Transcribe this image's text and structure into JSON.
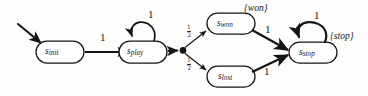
{
  "diagram": {
    "type": "markov-decision-state-machine",
    "title": "",
    "stroke_color": "#141414",
    "background_color": "#fdfdfb",
    "states": [
      {
        "id": "s_init",
        "base": "s",
        "subscript": "init",
        "x": 60,
        "y": 52
      },
      {
        "id": "s_play",
        "base": "s",
        "subscript": "play",
        "x": 143,
        "y": 52
      },
      {
        "id": "s_won",
        "base": "s",
        "subscript": "won",
        "x": 231,
        "y": 23
      },
      {
        "id": "s_lost",
        "base": "s",
        "subscript": "lost",
        "x": 231,
        "y": 77
      },
      {
        "id": "s_stop",
        "base": "s",
        "subscript": "stop",
        "x": 313,
        "y": 52
      }
    ],
    "branch_node": {
      "id": "probabilistic-branch-point",
      "x": 182,
      "y": 50
    },
    "start_arrow": {
      "id": "initial-state-arrow",
      "from_x": 18,
      "from_y": 24,
      "to_x": 43,
      "to_y": 44
    },
    "transitions": [
      {
        "id": "init-to-play",
        "from": "s_init",
        "to": "s_play",
        "label": "1"
      },
      {
        "id": "play-self-loop",
        "from": "s_play",
        "to": "s_play",
        "label": "1"
      },
      {
        "id": "play-to-branch",
        "from": "s_play",
        "to": "branch",
        "label": ""
      },
      {
        "id": "branch-to-won",
        "from": "branch",
        "to": "s_won",
        "label": "1/2",
        "numerator": "1",
        "denominator": "2"
      },
      {
        "id": "branch-to-lost",
        "from": "branch",
        "to": "s_lost",
        "label": "1/2",
        "numerator": "1",
        "denominator": "2"
      },
      {
        "id": "won-to-stop",
        "from": "s_won",
        "to": "s_stop",
        "label": "1"
      },
      {
        "id": "lost-to-stop",
        "from": "s_lost",
        "to": "s_stop",
        "label": "1"
      },
      {
        "id": "stop-self-loop",
        "from": "s_stop",
        "to": "s_stop",
        "label": "1"
      }
    ],
    "event_labels": [
      {
        "id": "won-event",
        "text": "{won}",
        "x": 244,
        "y": 5,
        "attached_to": "s_won"
      },
      {
        "id": "stop-event",
        "text": "{stop}",
        "x": 330,
        "y": 33,
        "attached_to": "s_stop"
      }
    ],
    "weights": {
      "init_to_play": "1",
      "play_loop": "1",
      "won_to_stop": "1",
      "lost_to_stop": "1",
      "stop_loop": "1"
    }
  }
}
